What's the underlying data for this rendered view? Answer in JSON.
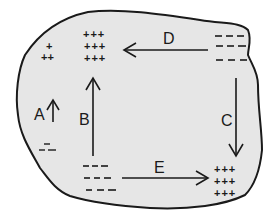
{
  "diagram": {
    "background_color": "#e6e6e6",
    "outline_color": "#1a1a1a",
    "groups": {
      "top_left_small": {
        "rows": [
          "+",
          "++"
        ]
      },
      "top_left_large": {
        "rows": [
          "+++",
          "+++",
          "+++"
        ]
      },
      "top_right": {
        "rows": [
          "---",
          "---",
          "---"
        ]
      },
      "middle_left": {
        "rows": [
          "–",
          "--"
        ]
      },
      "bottom_left": {
        "rows": [
          "---",
          "---",
          "---"
        ]
      },
      "bottom_right": {
        "rows": [
          "+++",
          "+++",
          "+++"
        ]
      }
    },
    "arrows": [
      {
        "label": "A",
        "direction": "up"
      },
      {
        "label": "B",
        "direction": "up",
        "from": "bottom_left",
        "to": "top_left_large"
      },
      {
        "label": "C",
        "direction": "down",
        "from": "top_right",
        "to": "bottom_right"
      },
      {
        "label": "D",
        "direction": "left",
        "from": "top_right",
        "to": "top_left_large"
      },
      {
        "label": "E",
        "direction": "right",
        "from": "bottom_left",
        "to": "bottom_right"
      }
    ]
  }
}
